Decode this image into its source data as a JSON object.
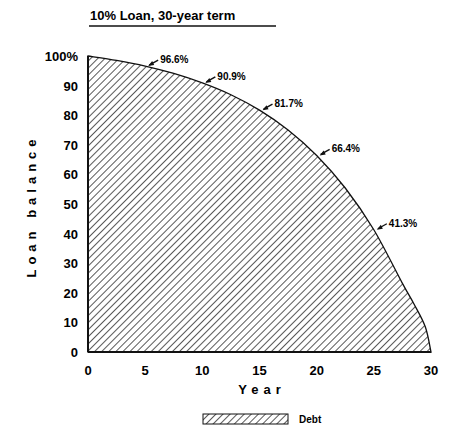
{
  "chart_data": {
    "type": "area",
    "title": "10% Loan, 30-year term",
    "xlabel": "Year",
    "ylabel": "Loan balance",
    "xlim": [
      0,
      30
    ],
    "ylim": [
      0,
      100
    ],
    "grid": false,
    "x_ticks": [
      "0",
      "5",
      "10",
      "15",
      "20",
      "25",
      "30"
    ],
    "y_ticks": [
      "0",
      "10",
      "20",
      "30",
      "40",
      "50",
      "60",
      "70",
      "80",
      "90",
      "100%"
    ],
    "legend": {
      "position": "bottom-center",
      "entries": [
        "Debt"
      ]
    },
    "series": [
      {
        "name": "Debt",
        "fill": "diagonal-hatch",
        "x": [
          0,
          2.5,
          5,
          7.5,
          10,
          12.5,
          15,
          17.5,
          20,
          22.5,
          25,
          27.5,
          28.5,
          29.5,
          30
        ],
        "values": [
          100,
          98.5,
          96.6,
          94.1,
          90.9,
          86.9,
          81.7,
          75.0,
          66.4,
          55.4,
          41.3,
          23.2,
          16.3,
          8.5,
          0
        ]
      }
    ],
    "annotations": [
      {
        "x": 5,
        "y": 96.6,
        "text": "96.6%"
      },
      {
        "x": 10,
        "y": 90.9,
        "text": "90.9%"
      },
      {
        "x": 15,
        "y": 81.7,
        "text": "81.7%"
      },
      {
        "x": 20,
        "y": 66.4,
        "text": "66.4%"
      },
      {
        "x": 25,
        "y": 41.3,
        "text": "41.3%"
      }
    ]
  },
  "colors": {
    "ink": "#111111",
    "background": "#ffffff"
  }
}
